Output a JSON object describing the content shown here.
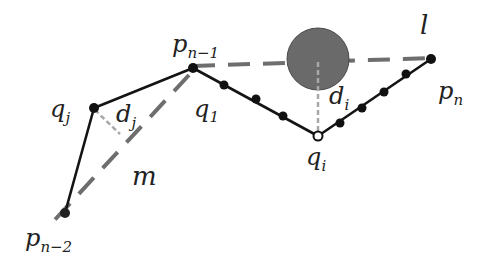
{
  "colors": {
    "polyline": "#141414",
    "dash_line": "#6e6e6e",
    "perpendicular": "#a8a8a8",
    "obstacle_fill": "#6a6a6a",
    "obstacle_stroke": "#4a4a4a",
    "node": "#111111"
  },
  "labels": {
    "p_n_minus_1": {
      "base": "p",
      "sub": "n−1"
    },
    "p_n": {
      "base": "p",
      "sub": "n"
    },
    "p_n_minus_2": {
      "base": "p",
      "sub": "n−2"
    },
    "q_j": {
      "base": "q",
      "sub": "j"
    },
    "q_1": {
      "base": "q",
      "sub": "1"
    },
    "q_i": {
      "base": "q",
      "sub": "i"
    },
    "d_j": {
      "base": "d",
      "sub": "j"
    },
    "d_i": {
      "base": "d",
      "sub": "i"
    },
    "l": "l",
    "m": "m"
  },
  "points": {
    "p_n_minus_2": [
      65,
      213
    ],
    "q_j": [
      94,
      108
    ],
    "p_n_minus_1": [
      193,
      68
    ],
    "q_i": [
      318,
      136
    ],
    "p_n": [
      431,
      59
    ]
  },
  "intermediate_nodes": [
    [
      224,
      85
    ],
    [
      256,
      99
    ],
    [
      283,
      116
    ],
    [
      340,
      123
    ],
    [
      362,
      108
    ],
    [
      384,
      92
    ],
    [
      406,
      74
    ]
  ],
  "obstacle": {
    "cx": 318,
    "cy": 59,
    "r": 31
  }
}
